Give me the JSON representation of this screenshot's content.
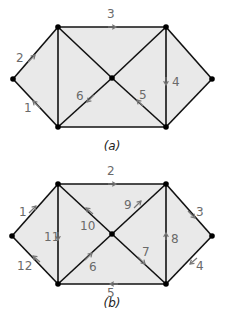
{
  "diagrams": [
    {
      "id": "a",
      "caption": "(a)",
      "nodes": {
        "L": [
          13,
          79
        ],
        "TL": [
          58,
          27
        ],
        "TR": [
          166,
          27
        ],
        "C": [
          112,
          78
        ],
        "R": [
          212,
          79
        ],
        "BL": [
          58,
          127
        ],
        "BR": [
          166,
          127
        ]
      },
      "edges": [
        [
          "L",
          "TL"
        ],
        [
          "TL",
          "TR"
        ],
        [
          "TR",
          "R"
        ],
        [
          "R",
          "BR"
        ],
        [
          "BR",
          "BL"
        ],
        [
          "BL",
          "L"
        ],
        [
          "TL",
          "BL"
        ],
        [
          "TR",
          "BR"
        ],
        [
          "TL",
          "C"
        ],
        [
          "C",
          "BR"
        ],
        [
          "TR",
          "C"
        ],
        [
          "C",
          "BL"
        ]
      ],
      "labels": [
        {
          "text": "2",
          "x": 16,
          "y": 62,
          "arrow": {
            "from": [
              28,
              62
            ],
            "to": [
              35,
              55
            ]
          }
        },
        {
          "text": "1",
          "x": 24,
          "y": 112,
          "arrow": {
            "from": [
              40,
              108
            ],
            "to": [
              33,
              101
            ]
          }
        },
        {
          "text": "3",
          "x": 107,
          "y": 18,
          "arrow": {
            "from": [
              108,
              27
            ],
            "to": [
              116,
              27
            ]
          }
        },
        {
          "text": "4",
          "x": 172,
          "y": 86,
          "arrow": {
            "from": [
              166,
              77
            ],
            "to": [
              166,
              85
            ]
          }
        },
        {
          "text": "5",
          "x": 139,
          "y": 99,
          "arrow": {
            "from": [
              143,
              106
            ],
            "to": [
              137,
              100
            ]
          }
        },
        {
          "text": "6",
          "x": 76,
          "y": 100,
          "arrow": {
            "from": [
              94,
              95
            ],
            "to": [
              87,
              102
            ]
          }
        }
      ]
    },
    {
      "id": "b",
      "caption": "(b)",
      "nodes": {
        "L": [
          12,
          236
        ],
        "TL": [
          58,
          184
        ],
        "TR": [
          166,
          184
        ],
        "C": [
          112,
          234
        ],
        "R": [
          212,
          236
        ],
        "BL": [
          58,
          284
        ],
        "BR": [
          166,
          284
        ]
      },
      "edges": [
        [
          "L",
          "TL"
        ],
        [
          "TL",
          "TR"
        ],
        [
          "TR",
          "R"
        ],
        [
          "R",
          "BR"
        ],
        [
          "BR",
          "BL"
        ],
        [
          "BL",
          "L"
        ],
        [
          "TL",
          "BL"
        ],
        [
          "TR",
          "BR"
        ],
        [
          "TL",
          "C"
        ],
        [
          "C",
          "BR"
        ],
        [
          "TR",
          "C"
        ],
        [
          "C",
          "BL"
        ]
      ],
      "labels": [
        {
          "text": "1",
          "x": 19,
          "y": 216,
          "arrow": {
            "from": [
              29,
              213
            ],
            "to": [
              36,
              206
            ]
          }
        },
        {
          "text": "2",
          "x": 107,
          "y": 175,
          "arrow": {
            "from": [
              108,
              184
            ],
            "to": [
              116,
              184
            ]
          }
        },
        {
          "text": "3",
          "x": 196,
          "y": 216,
          "arrow": {
            "from": [
              188,
              211
            ],
            "to": [
              195,
              218
            ]
          }
        },
        {
          "text": "4",
          "x": 196,
          "y": 270,
          "arrow": {
            "from": [
              197,
              258
            ],
            "to": [
              190,
              264
            ]
          }
        },
        {
          "text": "5",
          "x": 107,
          "y": 297,
          "arrow": {
            "from": [
              118,
              284
            ],
            "to": [
              110,
              284
            ]
          }
        },
        {
          "text": "6",
          "x": 89,
          "y": 271,
          "arrow": {
            "from": [
              85,
              260
            ],
            "to": [
              92,
              253
            ]
          }
        },
        {
          "text": "7",
          "x": 142,
          "y": 256,
          "arrow": {
            "from": [
              138,
              257
            ],
            "to": [
              145,
              264
            ]
          }
        },
        {
          "text": "8",
          "x": 171,
          "y": 243,
          "arrow": {
            "from": [
              166,
              240
            ],
            "to": [
              166,
              233
            ]
          }
        },
        {
          "text": "9",
          "x": 124,
          "y": 209,
          "arrow": {
            "from": [
              134,
              208
            ],
            "to": [
              141,
              201
            ]
          }
        },
        {
          "text": "10",
          "x": 80,
          "y": 230,
          "arrow": {
            "from": [
              93,
              214
            ],
            "to": [
              86,
              208
            ]
          }
        },
        {
          "text": "11",
          "x": 44,
          "y": 241,
          "arrow": {
            "from": [
              58,
              232
            ],
            "to": [
              58,
              240
            ]
          }
        },
        {
          "text": "12",
          "x": 17,
          "y": 270,
          "arrow": {
            "from": [
              40,
              262
            ],
            "to": [
              33,
              256
            ]
          }
        }
      ]
    }
  ]
}
